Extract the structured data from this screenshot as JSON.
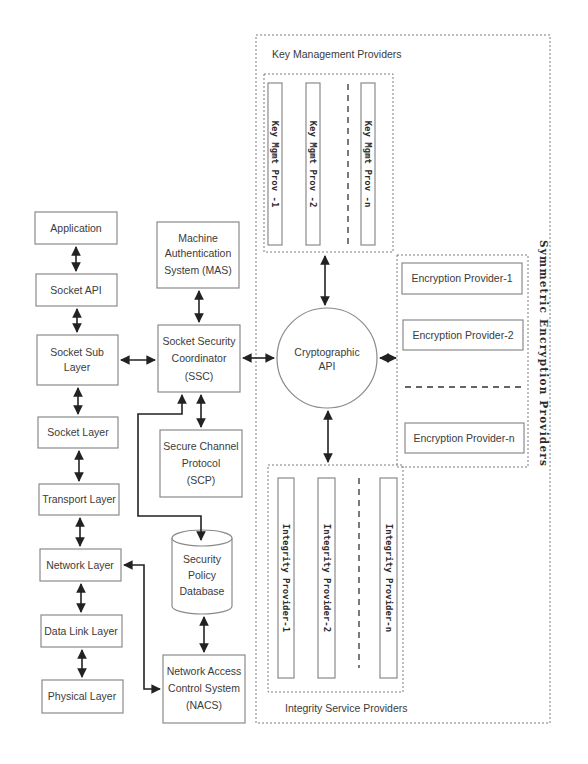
{
  "diagram": {
    "stack": {
      "application": "Application",
      "socket_api": "Socket API",
      "socket_sub_layer_1": "Socket Sub",
      "socket_sub_layer_2": "Layer",
      "socket_layer": "Socket Layer",
      "transport_layer": "Transport Layer",
      "network_layer": "Network Layer",
      "data_link_layer": "Data Link Layer",
      "physical_layer": "Physical Layer"
    },
    "mas": {
      "line1": "Machine",
      "line2": "Authentication",
      "line3": "System (MAS)"
    },
    "ssc": {
      "line1": "Socket Security",
      "line2": "Coordinator",
      "line3": "(SSC)"
    },
    "scp": {
      "line1": "Secure Channel",
      "line2": "Protocol",
      "line3": "(SCP)"
    },
    "spd": {
      "line1": "Security",
      "line2": "Policy",
      "line3": "Database"
    },
    "nacs": {
      "line1": "Network Access",
      "line2": "Control System",
      "line3": "(NACS)"
    },
    "crypto_api": {
      "line1": "Cryptographic",
      "line2": "API"
    },
    "key_management": {
      "title": "Key Management Providers",
      "providers": [
        "Key Mgmt Prov -1",
        "Key Mgmt Prov -2",
        "Key Mgmt Prov -n"
      ]
    },
    "symmetric_encryption": {
      "title": "Symmetric Encryption Providers",
      "providers": [
        "Encryption Provider-1",
        "Encryption Provider-2",
        "Encryption Provider-n"
      ]
    },
    "integrity": {
      "title": "Integrity Service Providers",
      "providers": [
        "Integrity Provider-1",
        "Integrity Provider-2",
        "Integrity Provider-n"
      ]
    },
    "colors": {
      "box_border": "#8a8a8a",
      "arrow": "#222222",
      "text": "#3a3a3a",
      "background": "#ffffff"
    }
  }
}
